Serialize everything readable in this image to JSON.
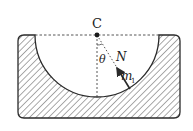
{
  "diagram": {
    "center_label": "C",
    "angle_label": "θ",
    "force_label": "N",
    "mass_label": "m",
    "mass_subscript": "1",
    "colors": {
      "stroke": "#2a2a2a",
      "hatch": "#555555",
      "background": "#ffffff"
    }
  }
}
